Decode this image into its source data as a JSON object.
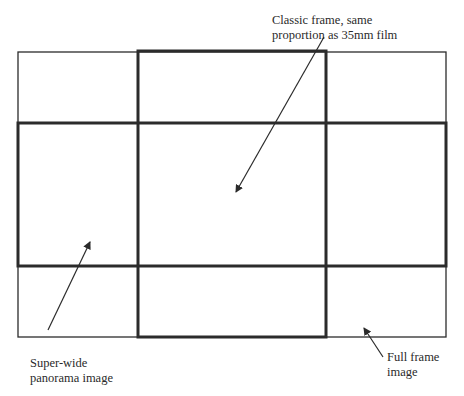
{
  "diagram": {
    "type": "frame-aspect-ratio-comparison",
    "colors": {
      "background": "#ffffff",
      "line": "#2b2b2b",
      "text": "#2a2a2a"
    },
    "frames": [
      {
        "id": "full-frame",
        "style": "thin",
        "x": 18,
        "y": 52,
        "width": 428,
        "height": 285
      },
      {
        "id": "classic-frame",
        "style": "thick",
        "x": 138,
        "y": 51,
        "width": 188,
        "height": 286
      },
      {
        "id": "panorama-frame",
        "style": "thick",
        "x": 18,
        "y": 123,
        "width": 428,
        "height": 143
      }
    ],
    "labels": {
      "classic": {
        "line1": "Classic frame, same",
        "line2": "proportion as 35mm film"
      },
      "panorama": {
        "line1": "Super-wide",
        "line2": "panorama image"
      },
      "fullframe": {
        "line1": "Full frame",
        "line2": "image"
      }
    },
    "arrows": [
      {
        "id": "classic-arrow",
        "from": [
          324,
          37
        ],
        "to": [
          236,
          192
        ]
      },
      {
        "id": "panorama-arrow",
        "from": [
          48,
          330
        ],
        "to": [
          90,
          242
        ]
      },
      {
        "id": "fullframe-arrow",
        "from": [
          383,
          357
        ],
        "to": [
          364,
          328
        ]
      }
    ]
  }
}
